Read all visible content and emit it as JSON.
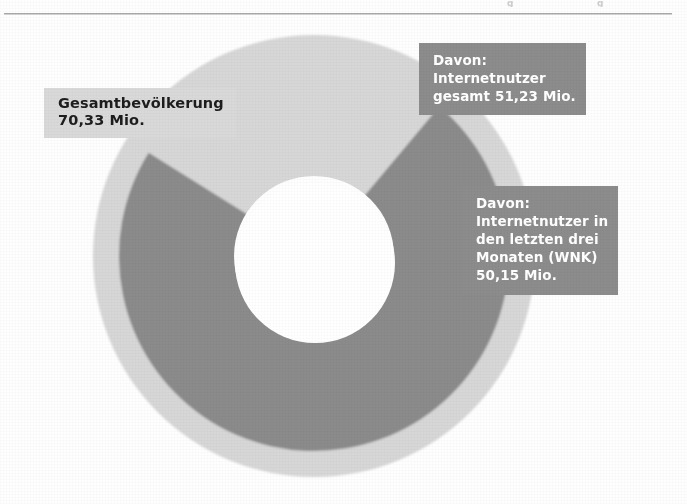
{
  "page": {
    "background_color": "#fefefe",
    "rule_color": "#9a9a9a"
  },
  "artifacts": {
    "glyph_a": "g",
    "glyph_b": "g"
  },
  "labels": {
    "total_population": {
      "text": "Gesamtbevölkerung\n70,33 Mio.",
      "line1": "Gesamtbevölkerung",
      "line2": "70,33 Mio.",
      "value": "70,33 Mio.",
      "box_color": "#d9d9d9",
      "text_color": "#1d1d1d"
    },
    "internet_users_total": {
      "text": "Davon:\nInternetnutzer\ngesamt 51,23 Mio.",
      "line1": "Davon:",
      "line2": "Internetnutzer",
      "line3": "gesamt 51,23 Mio.",
      "value": "51,23 Mio.",
      "box_color": "#8c8c8c",
      "text_color": "#ffffff"
    },
    "internet_users_wnk": {
      "text": "Davon:\nInternetnutzer in\nden letzten drei\nMonaten (WNK)\n50,15 Mio.",
      "line1": "Davon:",
      "line2": "Internetnutzer in",
      "line3": "den letzten drei",
      "line4": "Monaten (WNK)",
      "line5": "50,15 Mio.",
      "value": "50,15 Mio.",
      "box_color": "#8c8c8c",
      "text_color": "#ffffff"
    }
  },
  "chart_data": {
    "type": "pie",
    "title": "",
    "subtitle": "",
    "xlabel": "",
    "ylabel": "",
    "legend_position": "none",
    "grid": false,
    "unit": "Mio.",
    "variant": "nested-donut",
    "center": {
      "x": 314,
      "y": 256
    },
    "rings": [
      {
        "name": "Gesamtbevölkerung",
        "label": "Gesamtbevölkerung 70,33 Mio.",
        "value": 70.33,
        "share_pct": 100,
        "color": "#d7d7d7",
        "outer_radius": 221,
        "inner_radius": 80,
        "start_angle_deg": 0,
        "end_angle_deg": 360
      },
      {
        "name": "Internetnutzer gesamt",
        "label": "Davon: Internetnutzer gesamt 51,23 Mio.",
        "value": 51.23,
        "share_pct": 72.8,
        "color": "#8b8b8b",
        "outer_radius": 195,
        "inner_radius": 80,
        "start_angle_deg": -50,
        "end_angle_deg": 212
      }
    ],
    "center_hole": {
      "radius": 80,
      "color": "#ffffff"
    },
    "categories": [
      "Gesamtbevölkerung",
      "Internetnutzer gesamt",
      "Internetnutzer in den letzten drei Monaten (WNK)"
    ],
    "values": [
      70.33,
      51.23,
      50.15
    ],
    "value_labels": [
      "70,33 Mio.",
      "51,23 Mio.",
      "50,15 Mio."
    ]
  }
}
